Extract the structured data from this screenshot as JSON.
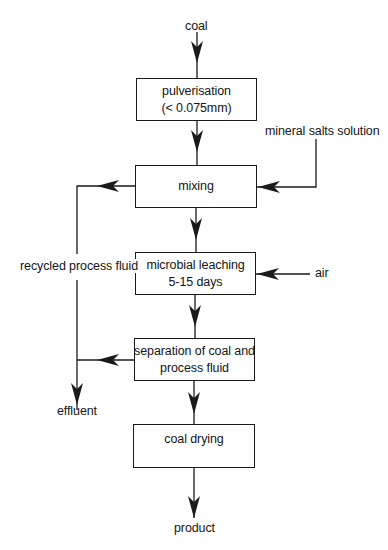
{
  "diagram": {
    "type": "process flow diagram",
    "inputs": {
      "coal": "coal",
      "mineral_salts": "mineral salts solution",
      "air": "air"
    },
    "steps": [
      {
        "id": "pulverisation",
        "line1": "pulverisation",
        "line2": "(< 0.075mm)"
      },
      {
        "id": "mixing",
        "line1": "mixing"
      },
      {
        "id": "microbial-leaching",
        "line1": "microbial leaching",
        "line2": "5-15 days"
      },
      {
        "id": "separation",
        "line1": "separation of coal and",
        "line2": "process fluid"
      },
      {
        "id": "coal-drying",
        "line1": "coal drying"
      }
    ],
    "side_flows": {
      "recycle": "recycled process fluid",
      "effluent": "effluent"
    },
    "outputs": {
      "product": "product"
    },
    "colors": {
      "ink": "#1a1a1a",
      "background": "#ffffff"
    }
  }
}
